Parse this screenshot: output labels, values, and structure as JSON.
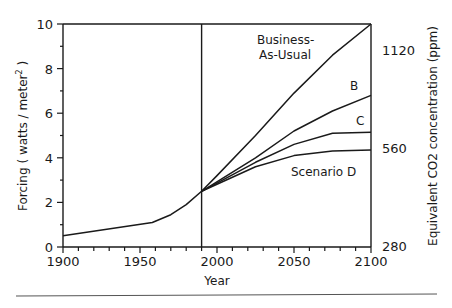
{
  "chart_data": {
    "type": "line",
    "title": "",
    "xlabel": "Year",
    "ylabel": "Forcing ( watts / meter² )",
    "ylabel_right": "Equivalent CO2 concentration (ppm)",
    "xlim": [
      1900,
      2100
    ],
    "ylim": [
      0,
      10
    ],
    "grid": false,
    "legend": "inline labels",
    "x_ticks": [
      1900,
      1950,
      2000,
      2050,
      2100
    ],
    "x_tick_labels": [
      "1900",
      "1950",
      "2000",
      "2050",
      "2100"
    ],
    "y_ticks": [
      0,
      2,
      4,
      6,
      8,
      10
    ],
    "y_tick_labels": [
      "0",
      "2",
      "4",
      "6",
      "8",
      "10"
    ],
    "right_ticks": [
      {
        "label": "280",
        "y": 0
      },
      {
        "label": "560",
        "y": 4.4
      },
      {
        "label": "1120",
        "y": 8.8
      }
    ],
    "vertical_marker": 1990,
    "series": [
      {
        "name": "Historical",
        "x": [
          1900,
          1958,
          1970,
          1980,
          1990
        ],
        "values": [
          0.5,
          1.1,
          1.45,
          1.9,
          2.5
        ]
      },
      {
        "name": "Business-As-Usual",
        "x": [
          1990,
          2000,
          2025,
          2050,
          2075,
          2100
        ],
        "values": [
          2.5,
          3.2,
          5.0,
          6.9,
          8.6,
          10.0
        ]
      },
      {
        "name": "B",
        "x": [
          1990,
          2025,
          2050,
          2075,
          2100
        ],
        "values": [
          2.5,
          4.0,
          5.2,
          6.1,
          6.8
        ]
      },
      {
        "name": "C",
        "x": [
          1990,
          2025,
          2050,
          2075,
          2100
        ],
        "values": [
          2.5,
          3.8,
          4.6,
          5.1,
          5.15
        ]
      },
      {
        "name": "Scenario D",
        "x": [
          1990,
          2025,
          2050,
          2075,
          2100
        ],
        "values": [
          2.5,
          3.6,
          4.1,
          4.3,
          4.35
        ]
      }
    ],
    "annotations": [
      {
        "text": "Business-",
        "line2": "As-Usual"
      },
      {
        "text": "B"
      },
      {
        "text": "C"
      },
      {
        "text": "Scenario D"
      }
    ]
  },
  "labels": {
    "ylabel": "Forcing ( watts / meter",
    "ylabel_sup": "2",
    "ylabel_close": " )",
    "ylabel_right": "Equivalent CO2 concentration (ppm)",
    "xlabel": "Year",
    "bau_1": "Business-",
    "bau_2": "As-Usual",
    "b": "B",
    "c": "C",
    "d": "Scenario D"
  }
}
